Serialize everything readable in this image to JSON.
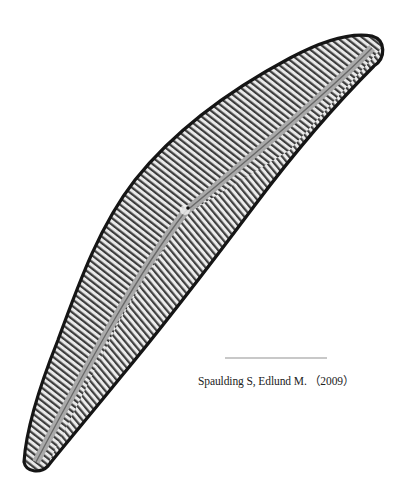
{
  "image": {
    "subject": "diatom valve (light micrograph)",
    "background_color": "#ffffff",
    "specimen": {
      "shape": "elongated lunate / cymbelloid valve",
      "top_apex": [
        375,
        42
      ],
      "bottom_apex": [
        32,
        468
      ],
      "central_nodule": [
        185,
        210
      ],
      "edge_color": "#1a1a1a",
      "striae_light": "#e6e6e6",
      "striae_dark": "#3a3a3a"
    },
    "scale_bar": {
      "x_start": 225,
      "x_end": 327,
      "y": 358,
      "color": "#c8c8c8"
    }
  },
  "caption": {
    "text": "Spaulding S, Edlund M. （2009）"
  }
}
